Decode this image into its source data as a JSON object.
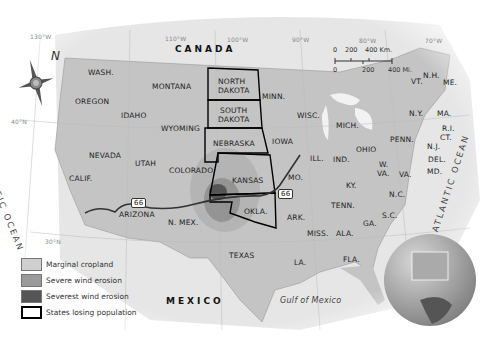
{
  "map": {
    "colors": {
      "us_land": "#c4c4c4",
      "foreign_land": "#e6e6e6",
      "water": "#ffffff",
      "marginal_cropland": "#cfcfcf",
      "severe_wind_erosion": "#9a9a9a",
      "severest_wind_erosion": "#555555",
      "states_losing_population_border": "#000000"
    },
    "countries": {
      "canada": "CANADA",
      "mexico": "MEXICO"
    },
    "water_bodies": {
      "pacific": "PACIFIC OCEAN",
      "atlantic": "ATLANTIC OCEAN",
      "gulf": "Gulf of Mexico"
    },
    "coordinates": {
      "lon_130": "130°W",
      "lon_110": "110°W",
      "lon_100": "100°W",
      "lon_90": "90°W",
      "lon_80": "80°W",
      "lon_70": "70°W",
      "lat_40": "40°N",
      "lat_30": "30°N"
    },
    "states": {
      "wash": "WASH.",
      "oregon": "OREGON",
      "idaho": "IDAHO",
      "montana": "MONTANA",
      "wyoming": "WYOMING",
      "nevada": "NEVADA",
      "utah": "UTAH",
      "calif": "CALIF.",
      "colorado": "COLORADO",
      "arizona": "ARIZONA",
      "n_mex": "N. MEX.",
      "north_dakota_1": "NORTH",
      "north_dakota_2": "DAKOTA",
      "south_dakota_1": "SOUTH",
      "south_dakota_2": "DAKOTA",
      "nebraska": "NEBRASKA",
      "kansas": "KANSAS",
      "okla": "OKLA.",
      "texas": "TEXAS",
      "minn": "MINN.",
      "iowa": "IOWA",
      "mo": "MO.",
      "ark": "ARK.",
      "la": "LA.",
      "wisc": "WISC.",
      "ill": "ILL.",
      "mich": "MICH.",
      "ind": "IND.",
      "ohio": "OHIO",
      "ky": "KY.",
      "tenn": "TENN.",
      "miss": "MISS.",
      "ala": "ALA.",
      "ga": "GA.",
      "fla": "FLA.",
      "sc": "S.C.",
      "nc": "N.C.",
      "va": "VA.",
      "wva_1": "W.",
      "wva_2": "VA.",
      "penn": "PENN.",
      "ny": "N.Y.",
      "vt": "VT.",
      "nh": "N.H.",
      "me": "ME.",
      "ma": "MA.",
      "ri": "R.I.",
      "ct": "CT.",
      "nj": "N.J.",
      "del": "DEL.",
      "md": "MD."
    },
    "route": {
      "label": "66"
    },
    "compass": {
      "north_label": "N"
    },
    "scale_bar": {
      "km_0": "0",
      "km_200": "200",
      "km_400": "400 Km.",
      "mi_0": "0",
      "mi_200": "200",
      "mi_400": "400 Mi."
    },
    "legend": [
      {
        "label": "Marginal cropland",
        "color": "#cfcfcf"
      },
      {
        "label": "Severe wind erosion",
        "color": "#9a9a9a"
      },
      {
        "label": "Severest wind erosion",
        "color": "#555555"
      },
      {
        "label": "States losing population",
        "color": "#ffffff"
      }
    ]
  }
}
